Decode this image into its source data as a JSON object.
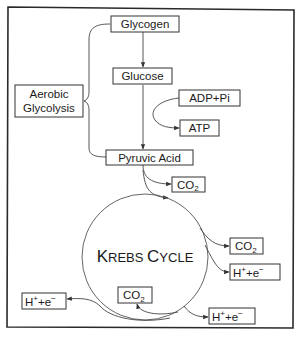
{
  "diagram": {
    "colors": {
      "stroke": "#333333",
      "background": "#ffffff",
      "text": "#1a1a1a"
    },
    "nodes": {
      "glycogen": "Glycogen",
      "glucose": "Glucose",
      "aerobic_glycolysis_line1": "Aerobic",
      "aerobic_glycolysis_line2": "Glycolysis",
      "adp_pi": "ADP+Pi",
      "atp": "ATP",
      "pyruvic_acid": "Pyruvic Acid",
      "co2_main": "CO",
      "co2_sub": "2",
      "h_base": "H",
      "h_sup": "+",
      "plus_e": "+e",
      "e_sup": "−",
      "krebs_k": "K",
      "krebs_rebs": "REBS",
      "krebs_c": "C",
      "krebs_ycle": "YCLE"
    },
    "products": {
      "co2_after_pyruvic": {
        "label": "CO2"
      },
      "co2_krebs_right": {
        "label": "CO2"
      },
      "h_e_krebs_right": {
        "label": "H+ + e-"
      },
      "h_e_krebs_left": {
        "label": "H+ + e-"
      },
      "co2_krebs_inner": {
        "label": "CO2"
      },
      "h_e_krebs_bottom": {
        "label": "H+ + e-"
      }
    },
    "edges": [
      {
        "from": "Glycogen",
        "to": "Glucose"
      },
      {
        "from": "Glucose",
        "to": "Pyruvic Acid"
      },
      {
        "from": "ADP+Pi",
        "to": "ATP"
      },
      {
        "from": "Pyruvic Acid",
        "to": "CO2"
      },
      {
        "from": "Pyruvic Acid",
        "to": "Krebs Cycle"
      },
      {
        "from": "Krebs Cycle",
        "to": "CO2"
      },
      {
        "from": "Krebs Cycle",
        "to": "H+ + e-"
      },
      {
        "from": "Krebs Cycle",
        "to": "H+ + e-"
      },
      {
        "from": "Krebs Cycle",
        "to": "CO2"
      },
      {
        "from": "Krebs Cycle",
        "to": "H+ + e-"
      }
    ]
  }
}
